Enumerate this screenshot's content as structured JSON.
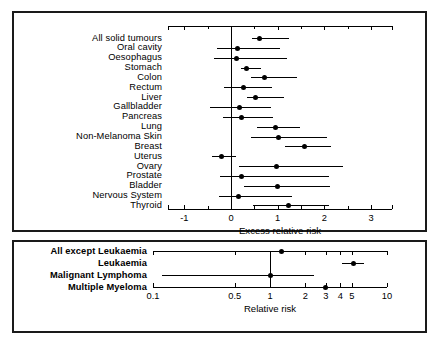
{
  "figure": {
    "background": "#ffffff",
    "ink": "#000000"
  },
  "chart_data": [
    {
      "type": "scatter",
      "name": "solid-tumour-panel",
      "title": "",
      "xlabel": "Excess relative risk",
      "ylabel": "",
      "xscale": "linear",
      "xlim": [
        -1.35,
        3.45
      ],
      "ticks_major": [
        -1,
        0,
        1,
        2,
        3
      ],
      "tick_labels": [
        "-1",
        "0",
        "1",
        "2",
        "3"
      ],
      "ticks_minor": [
        -0.5,
        0.5,
        1.5,
        2.5
      ],
      "reference_line": 0,
      "grid": false,
      "legend": "none",
      "categories": [
        "All solid tumours",
        "Oral cavity",
        "Oesophagus",
        "Stomach",
        "Colon",
        "Rectum",
        "Liver",
        "Gallbladder",
        "Pancreas",
        "Lung",
        "Non-Melanoma Skin",
        "Breast",
        "Uterus",
        "Ovary",
        "Prostate",
        "Bladder",
        "Nervous System",
        "Thyroid"
      ],
      "values": [
        0.61,
        0.14,
        0.12,
        0.34,
        0.72,
        0.26,
        0.52,
        0.19,
        0.22,
        0.95,
        1.02,
        1.58,
        -0.21,
        0.98,
        0.22,
        1.0,
        0.16,
        1.24
      ],
      "ci_low": [
        0.45,
        -0.3,
        -0.36,
        0.22,
        0.42,
        -0.15,
        0.34,
        -0.45,
        -0.18,
        0.55,
        0.43,
        1.16,
        -0.4,
        0.17,
        -0.23,
        0.27,
        -0.25,
        0.48
      ],
      "ci_high": [
        1.25,
        1.05,
        1.2,
        0.65,
        1.42,
        0.87,
        1.13,
        0.86,
        0.9,
        1.48,
        2.06,
        2.15,
        0.1,
        2.4,
        2.1,
        2.12,
        1.3,
        2.1
      ]
    },
    {
      "type": "scatter",
      "name": "haematological-panel",
      "title": "",
      "xlabel": "Relative risk",
      "ylabel": "",
      "xscale": "log",
      "xlim": [
        0.1,
        10
      ],
      "ticks_major": [
        0.1,
        0.5,
        1,
        2,
        3,
        4,
        5,
        10
      ],
      "tick_labels": [
        "0.1",
        "0.5",
        "1",
        "2",
        "3",
        "4",
        "5",
        "10"
      ],
      "reference_line": 1,
      "grid": false,
      "legend": "none",
      "categories": [
        "All except Leukaemia",
        "Leukaemia",
        "Malignant Lymphoma",
        "Multiple Myeloma"
      ],
      "values": [
        1.25,
        5.2,
        1.0,
        3.0
      ],
      "ci_low": [
        0.9,
        4.1,
        0.12,
        1.65
      ],
      "ci_high": [
        1.75,
        6.4,
        2.4,
        5.6
      ]
    }
  ]
}
